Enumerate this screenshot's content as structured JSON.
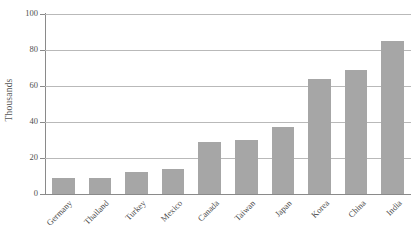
{
  "chart_data": {
    "type": "bar",
    "title": "",
    "subtitle": "",
    "xlabel": "",
    "ylabel": "Thousands",
    "categories": [
      "Germany",
      "Thailand",
      "Turkey",
      "Mexico",
      "Canada",
      "Taiwan",
      "Japan",
      "Korea",
      "China",
      "India"
    ],
    "values": [
      9,
      9,
      12,
      14,
      29,
      30,
      37,
      64,
      69,
      85
    ],
    "ylim": [
      0,
      100
    ],
    "yticks": [
      0,
      20,
      40,
      60,
      80,
      100
    ],
    "ytick_labels": [
      "0",
      "20",
      "40",
      "60",
      "80",
      "100"
    ],
    "grid": true,
    "legend": "none",
    "bar_color": "#a6a6a6",
    "gridline_color": "#b9b9b9",
    "axis_color": "#8a8a8a",
    "background_color": "#ffffff",
    "xtick_label_rotation": "-45"
  }
}
